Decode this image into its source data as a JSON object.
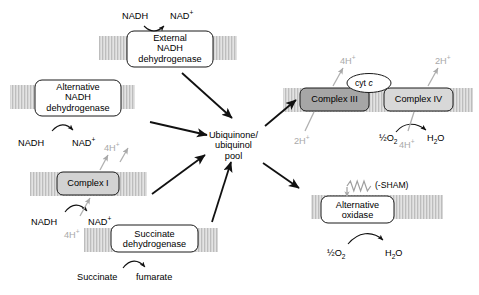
{
  "diagram": {
    "type": "pathway-diagram",
    "canvas": {
      "width": 479,
      "height": 295
    },
    "colors": {
      "background": "#ffffff",
      "membrane": "#c9c9c9",
      "complex_i_fill": "#d2d2d2",
      "complex_iii_fill": "#a6a6a6",
      "complex_iv_fill": "#d8d8d8",
      "plain_box_fill": "#ffffff",
      "stroke": "#1a1a1a",
      "proton_gray": "#a9a9a9"
    }
  },
  "enzymes": [
    {
      "id": "external-nadh-dehydrogenase",
      "lines": [
        "External",
        "NADH",
        "dehydrogenase"
      ],
      "fill": "plain"
    },
    {
      "id": "alternative-nadh-dehydrogenase",
      "lines": [
        "Alternative",
        "NADH",
        "dehydrogenase"
      ],
      "fill": "plain"
    },
    {
      "id": "complex-i",
      "lines": [
        "Complex I"
      ],
      "fill": "gray"
    },
    {
      "id": "succinate-dehydrogenase",
      "lines": [
        "Succinate",
        "dehydrogenase"
      ],
      "fill": "plain"
    },
    {
      "id": "complex-iii",
      "lines": [
        "Complex III"
      ],
      "fill": "dark-gray"
    },
    {
      "id": "complex-iv",
      "lines": [
        "Complex IV"
      ],
      "fill": "light-gray"
    },
    {
      "id": "alternative-oxidase",
      "lines": [
        "Alternative",
        "oxidase"
      ],
      "fill": "plain"
    }
  ],
  "pool": {
    "id": "ubiquinone-ubiquinol-pool",
    "lines": [
      "Ubiquinone/",
      "ubiquinol",
      "pool"
    ]
  },
  "carrier": {
    "id": "cyt-c",
    "prefix": "cyt ",
    "italic": "c"
  },
  "inhibitor": {
    "id": "sham-inhibitor",
    "label": "(-SHAM)"
  },
  "metabolites": {
    "top_nadh": "NADH",
    "top_nad_base": "NAD",
    "top_nad_sup": "+",
    "alt_nadh": "NADH",
    "alt_nad_base": "NAD",
    "alt_nad_sup": "+",
    "ci_nadh": "NADH",
    "ci_nad_base": "NAD",
    "ci_nad_sup": "+",
    "succinate": "Succinate",
    "fumarate": "fumarate",
    "oxygen_half": "½O",
    "oxygen_sub": "2",
    "water_h": "H",
    "water_sub": "2",
    "water_o": "O",
    "aox_oxygen_half": "½O",
    "aox_oxygen_sub": "2",
    "aox_water_h": "H",
    "aox_water_sub": "2",
    "aox_water_o": "O"
  },
  "protons": {
    "ci_out_base": "4H",
    "ci_out_sup": "+",
    "ci_in_base": "4H",
    "ci_in_sup": "+",
    "ciii_out_base": "4H",
    "ciii_out_sup": "+",
    "ciii_in_base": "2H",
    "ciii_in_sup": "+",
    "civ_out_base": "2H",
    "civ_out_sup": "+",
    "civ_in_base": "4H",
    "civ_in_sup": "+"
  }
}
